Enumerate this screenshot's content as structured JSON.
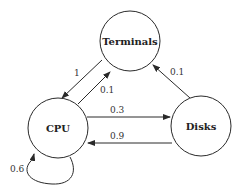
{
  "diagram": {
    "type": "state-transition",
    "nodes": [
      {
        "id": "terminals",
        "label": "Terminals"
      },
      {
        "id": "cpu",
        "label": "CPU"
      },
      {
        "id": "disks",
        "label": "Disks"
      }
    ],
    "edges": [
      {
        "from": "terminals",
        "to": "cpu",
        "label": "1"
      },
      {
        "from": "cpu",
        "to": "terminals",
        "label": "0.1"
      },
      {
        "from": "cpu",
        "to": "disks",
        "label": "0.3"
      },
      {
        "from": "disks",
        "to": "cpu",
        "label": "0.9"
      },
      {
        "from": "disks",
        "to": "terminals",
        "label": "0.1"
      },
      {
        "from": "cpu",
        "to": "cpu",
        "label": "0.6"
      }
    ]
  }
}
